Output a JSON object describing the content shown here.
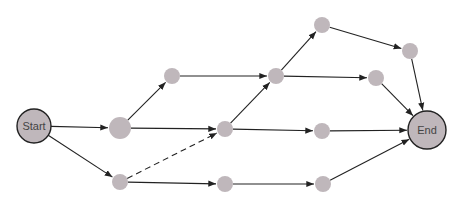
{
  "diagram": {
    "type": "network-activity-diagram",
    "colors": {
      "node_fill": "#bfb7bb",
      "edge": "#222222",
      "terminal_stroke": "#222222",
      "label": "#444444"
    },
    "nodes": [
      {
        "id": "start",
        "label": "Start",
        "x": 34,
        "y": 126,
        "r": 17,
        "terminal": true
      },
      {
        "id": "a",
        "label": "",
        "x": 120,
        "y": 128,
        "r": 11
      },
      {
        "id": "b",
        "label": "",
        "x": 172,
        "y": 76,
        "r": 8
      },
      {
        "id": "c",
        "label": "",
        "x": 120,
        "y": 182,
        "r": 8
      },
      {
        "id": "d",
        "label": "",
        "x": 276,
        "y": 76,
        "r": 8
      },
      {
        "id": "e",
        "label": "",
        "x": 225,
        "y": 129,
        "r": 8
      },
      {
        "id": "f",
        "label": "",
        "x": 322,
        "y": 25,
        "r": 8
      },
      {
        "id": "g",
        "label": "",
        "x": 376,
        "y": 78,
        "r": 8
      },
      {
        "id": "h",
        "label": "",
        "x": 322,
        "y": 131,
        "r": 8
      },
      {
        "id": "i",
        "label": "",
        "x": 225,
        "y": 184,
        "r": 8
      },
      {
        "id": "j",
        "label": "",
        "x": 323,
        "y": 184,
        "r": 8
      },
      {
        "id": "k",
        "label": "",
        "x": 410,
        "y": 51,
        "r": 8
      },
      {
        "id": "end",
        "label": "End",
        "x": 427,
        "y": 130,
        "r": 19,
        "terminal": true
      }
    ],
    "edges": [
      {
        "from": "start",
        "to": "a"
      },
      {
        "from": "start",
        "to": "c"
      },
      {
        "from": "a",
        "to": "b"
      },
      {
        "from": "a",
        "to": "e"
      },
      {
        "from": "c",
        "to": "e",
        "dashed": true
      },
      {
        "from": "c",
        "to": "i"
      },
      {
        "from": "b",
        "to": "d"
      },
      {
        "from": "e",
        "to": "d"
      },
      {
        "from": "e",
        "to": "h"
      },
      {
        "from": "i",
        "to": "j"
      },
      {
        "from": "d",
        "to": "f"
      },
      {
        "from": "d",
        "to": "g"
      },
      {
        "from": "f",
        "to": "k"
      },
      {
        "from": "k",
        "to": "end"
      },
      {
        "from": "g",
        "to": "end"
      },
      {
        "from": "h",
        "to": "end"
      },
      {
        "from": "j",
        "to": "end"
      }
    ]
  }
}
